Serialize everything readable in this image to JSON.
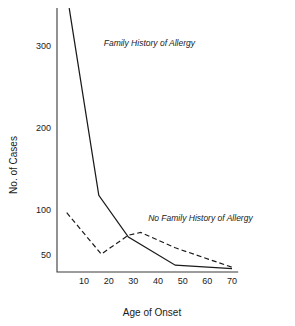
{
  "chart_data": {
    "type": "line",
    "title": "",
    "xlabel": "Age of Onset",
    "ylabel": "No. of Cases",
    "grid": false,
    "legend_position": "inline-annotation",
    "xlim": [
      0,
      72
    ],
    "ylim": [
      25,
      400
    ],
    "xticks": [
      10,
      20,
      30,
      40,
      50,
      60,
      70
    ],
    "xtick_labels": [
      "10",
      "20",
      "30",
      "40",
      "50",
      "60",
      "70"
    ],
    "yticks": [
      50,
      100,
      200,
      300
    ],
    "ytick_labels": [
      "50",
      "100",
      "200",
      "300"
    ],
    "series": [
      {
        "name": "Family History of Allergy",
        "style": "solid",
        "x": [
          4,
          16,
          28,
          47,
          70
        ],
        "values": [
          390,
          118,
          70,
          35,
          30
        ]
      },
      {
        "name": "No Family History of Allergy",
        "style": "dashed",
        "x": [
          3,
          17,
          28,
          33,
          47,
          70
        ],
        "values": [
          97,
          51,
          72,
          75,
          58,
          32
        ]
      }
    ],
    "annotations": [
      {
        "text": "Family History of Allergy",
        "x": 18,
        "y": 300
      },
      {
        "text": "No Family History of Allergy",
        "x": 36,
        "y": 88
      }
    ]
  },
  "colors": {
    "line": "#1a1a1a",
    "axis": "#3a3a3a",
    "background": "#ffffff"
  }
}
